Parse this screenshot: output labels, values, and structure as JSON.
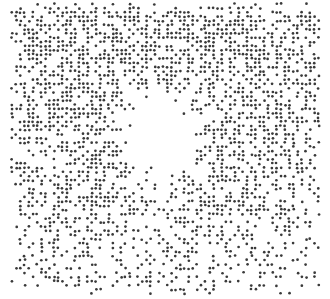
{
  "artwork": {
    "description": "Stippled halftone square with white starburst",
    "width": 330,
    "height": 299,
    "background": "#ffffff",
    "dot_color": "#3a3a3a",
    "field": {
      "x0": 12,
      "y0": 4,
      "x1": 322,
      "y1": 296,
      "corner_radius": 14
    },
    "grid_step": 4.2,
    "dot_radius": 1.35,
    "density": {
      "top": 0.62,
      "middle": 0.5,
      "bottom": 0.24
    },
    "edge_fade_px": 14,
    "star": {
      "center": [
        160,
        135
      ],
      "core_radius": 30,
      "rays": [
        {
          "angle": -125,
          "length": 75
        },
        {
          "angle": -98,
          "length": 72
        },
        {
          "angle": -55,
          "length": 75
        },
        {
          "angle": -20,
          "length": 68
        },
        {
          "angle": 10,
          "length": 55
        },
        {
          "angle": 45,
          "length": 70
        },
        {
          "angle": 88,
          "length": 76
        },
        {
          "angle": 120,
          "length": 62
        },
        {
          "angle": 150,
          "length": 52
        },
        {
          "angle": 178,
          "length": 68
        },
        {
          "angle": -150,
          "length": 58
        },
        {
          "angle": 65,
          "length": 50
        },
        {
          "angle": -75,
          "length": 48
        },
        {
          "angle": 28,
          "length": 45
        }
      ],
      "ray_half_width_deg": 7
    }
  }
}
